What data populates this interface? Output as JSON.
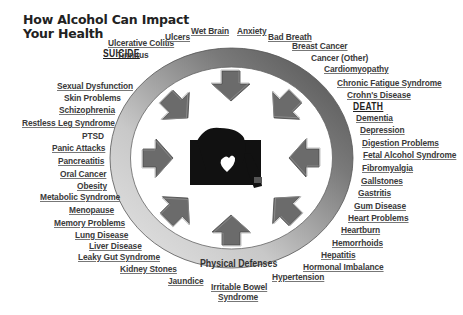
{
  "title": {
    "line1": "How Alcohol Can Impact",
    "line2": "Your Health"
  },
  "center": {
    "image": "silhouette-person-drinking-icon",
    "ring_label": "Physical Defenses",
    "arrow_count": 8
  },
  "colors": {
    "ring_light": "#d9d9d9",
    "ring_dark": "#5a5a5a",
    "arrow": "#6b6b6b",
    "text": "#3a3a3a",
    "background": "#ffffff"
  },
  "headings": {
    "suicide": "SUICIDE",
    "death": "DEATH"
  },
  "labels": {
    "ulcerative_colitis": "Ulcerative Colitis",
    "tinnitus": "Tinnitus",
    "ulcers": "Ulcers",
    "wet_brain": "Wet Brain",
    "anxiety": "Anxiety",
    "bad_breath": "Bad Breath",
    "breast_cancer": "Breast Cancer",
    "cancer_other": "Cancer (Other)",
    "cardiomyopathy": "Cardiomyopathy",
    "chronic_fatigue": "Chronic Fatigue Syndrome",
    "crohns": "Crohn's Disease",
    "dementia": "Dementia",
    "depression": "Depression",
    "digestion": "Digestion Problems",
    "fetal_alcohol": "Fetal Alcohol Syndrome",
    "fibromyalgia": "Fibromyalgia",
    "gallstones": "Gallstones",
    "gastritis": "Gastritis",
    "gum_disease": "Gum Disease",
    "heart_problems": "Heart Problems",
    "heartburn": "Heartburn",
    "hemorrhoids": "Hemorrhoids",
    "hepatitis": "Hepatitis",
    "hormonal": "Hormonal  Imbalance",
    "hypertension": "Hypertension",
    "ibs_1": "Irritable Bowel",
    "ibs_2": "Syndrome",
    "jaundice": "Jaundice",
    "kidney_stones": "Kidney Stones",
    "leaky_gut": "Leaky Gut Syndrome",
    "liver_disease": "Liver Disease",
    "lung_disease": "Lung Disease",
    "memory": "Memory Problems",
    "menopause": "Menopause",
    "metabolic": "Metabolic Syndrome",
    "obesity": "Obesity",
    "oral_cancer": "Oral Cancer",
    "pancreatitis": "Pancreatitis",
    "panic_attacks": "Panic Attacks",
    "ptsd": "PTSD",
    "restless_leg": "Restless Leg Syndrome",
    "schizophrenia": "Schizophrenia",
    "skin_problems": "Skin Problems",
    "sexual_dysfunction": "Sexual Dysfunction"
  }
}
